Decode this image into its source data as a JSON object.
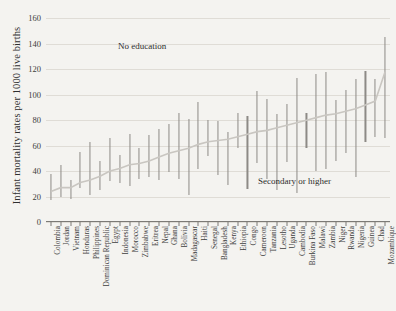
{
  "chart_data": {
    "type": "line",
    "title": "",
    "xlabel": "",
    "ylabel": "Infant mortality rates per 1000 live births",
    "ylim": [
      0,
      165
    ],
    "yticks": [
      0,
      20,
      40,
      60,
      80,
      100,
      120,
      140,
      160
    ],
    "grid": true,
    "legend_position": "none",
    "annotations": [
      {
        "text": "No education",
        "x_index": 9,
        "y": 140
      },
      {
        "text": "Secondary or higher",
        "x_index": 26,
        "y": 34
      }
    ],
    "categories": [
      "Colombia",
      "Jordan",
      "Vietnam",
      "Honduras",
      "Philippines",
      "Dominican Republic",
      "Egypt",
      "Indonesia",
      "Morocco",
      "Zimbabwe",
      "Eritrea",
      "Nepal",
      "Ghana",
      "Bolivia",
      "Madagascar",
      "Haiti",
      "Senegal",
      "Bangladesh",
      "Kenya",
      "Ethiopia",
      "Congo",
      "Cameroon",
      "Tanzania",
      "Lesotho",
      "Uganda",
      "Cambodia",
      "Burkina Faso",
      "Malawi",
      "Zambia",
      "Niger",
      "Rwanda",
      "Nigeria",
      "Guinea",
      "Chad",
      "Mozambique"
    ],
    "series": [
      {
        "name": "No education",
        "values": [
          38,
          45,
          33,
          55,
          63,
          48,
          66,
          53,
          69,
          58,
          68,
          73,
          77,
          86,
          81,
          94,
          80,
          79,
          71,
          86,
          83,
          103,
          97,
          85,
          93,
          113,
          86,
          116,
          118,
          96,
          104,
          112,
          119,
          112,
          145
        ]
      },
      {
        "name": "Secondary or higher",
        "values": [
          17,
          20,
          18,
          27,
          21,
          25,
          32,
          31,
          28,
          34,
          35,
          33,
          39,
          34,
          21,
          42,
          52,
          37,
          29,
          58,
          26,
          46,
          34,
          25,
          47,
          23,
          58,
          40,
          42,
          48,
          54,
          35,
          63,
          67,
          66
        ]
      },
      {
        "name": "Overall mean",
        "values": [
          24,
          27,
          27,
          31,
          33,
          36,
          40,
          42,
          45,
          46,
          48,
          51,
          54,
          56,
          58,
          61,
          63,
          64,
          65,
          67,
          69,
          71,
          72,
          74,
          76,
          78,
          80,
          82,
          84,
          85,
          87,
          89,
          92,
          95,
          118
        ]
      }
    ]
  }
}
